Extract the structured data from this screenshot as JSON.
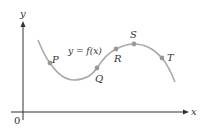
{
  "figure": {
    "axes": {
      "x_label": "x",
      "y_label": "y",
      "origin_label": "0",
      "axis_color": "#333333"
    },
    "curve": {
      "label": "y = f(x)",
      "color": "#aaaaaa"
    },
    "points": [
      {
        "name": "P",
        "cx": 50,
        "cy": 63
      },
      {
        "name": "Q",
        "cx": 97,
        "cy": 68
      },
      {
        "name": "R",
        "cx": 116,
        "cy": 49
      },
      {
        "name": "S",
        "cx": 134,
        "cy": 44
      },
      {
        "name": "T",
        "cx": 162,
        "cy": 58
      }
    ],
    "point_color": "#999999"
  }
}
